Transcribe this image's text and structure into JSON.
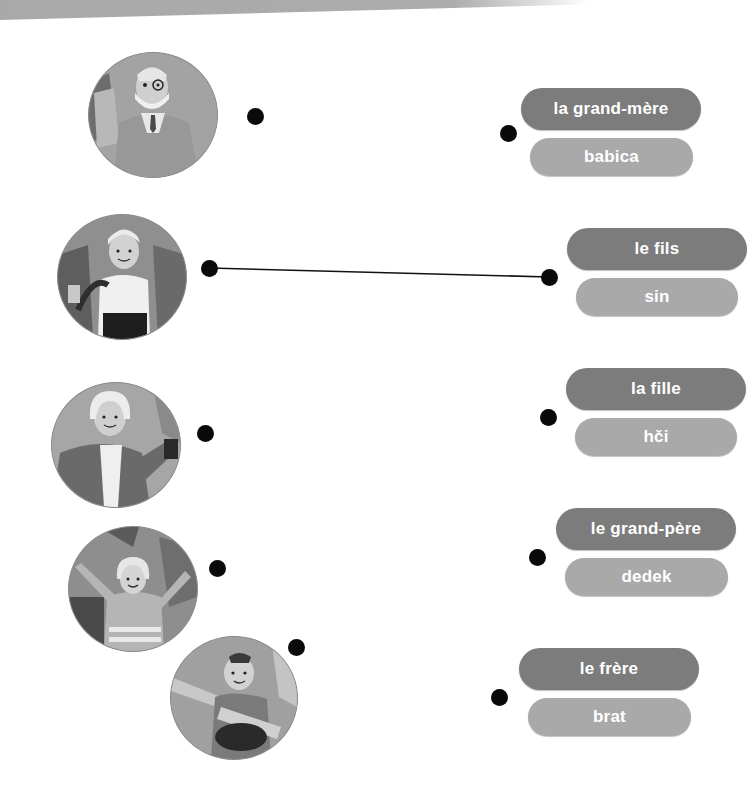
{
  "exercise": {
    "type": "matching",
    "people": [
      {
        "name": "grandfather-photo",
        "description": "older man with glasses and white beard"
      },
      {
        "name": "boy-photo",
        "description": "young boy with blond hair"
      },
      {
        "name": "grandmother-photo",
        "description": "older woman with white hair"
      },
      {
        "name": "girl-photo",
        "description": "young girl with arms raised"
      },
      {
        "name": "boy2-photo",
        "description": "boy with arms outstretched"
      }
    ],
    "pairs": [
      {
        "french": "la grand-mère",
        "slovene": "babica"
      },
      {
        "french": "le fils",
        "slovene": "sin"
      },
      {
        "french": "la fille",
        "slovene": "hči"
      },
      {
        "french": "le grand-père",
        "slovene": "dedek"
      },
      {
        "french": "le frère",
        "slovene": "brat"
      }
    ],
    "connections": [
      {
        "from_photo": 1,
        "to_pair": 1
      }
    ]
  },
  "colors": {
    "french_pill": "#7c7c7c",
    "slovene_pill": "#a9a9a9",
    "dot": "#0a0a0a",
    "line": "#111111"
  }
}
